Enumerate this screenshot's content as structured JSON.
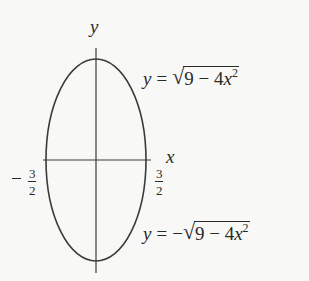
{
  "figure": {
    "type": "ellipse_graph",
    "stroke_color": "#3a3a3a",
    "background": "#f8f8f6",
    "axes": {
      "x_label": "x",
      "y_label": "y"
    },
    "ellipse": {
      "equation": "4x^2 + y^2 = 9",
      "semi_axis_x": 1.5,
      "semi_axis_y": 3
    },
    "tick_labels": {
      "left": {
        "sign": "−",
        "numerator": "3",
        "denominator": "2"
      },
      "right": {
        "sign": "",
        "numerator": "3",
        "denominator": "2"
      }
    },
    "equations": {
      "upper": {
        "lhs": "y",
        "eq": "=",
        "sign": "",
        "radical": "√",
        "radicand_a": "9 − 4",
        "radicand_var": "x",
        "exponent": "2",
        "text": "y = √(9 − 4x²)"
      },
      "lower": {
        "lhs": "y",
        "eq": "=",
        "sign": "−",
        "radical": "√",
        "radicand_a": "9 − 4",
        "radicand_var": "x",
        "exponent": "2",
        "text": "y = −√(9 − 4x²)"
      }
    }
  }
}
